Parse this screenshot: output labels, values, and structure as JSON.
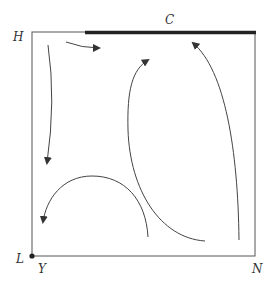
{
  "diagram": {
    "type": "phase-flow-diagram",
    "labels": {
      "top_left": "H",
      "top_bar": "C",
      "bottom_left": "L",
      "origin_below": "Y",
      "bottom_right": "N"
    },
    "colors": {
      "frame": "#555555",
      "thick_bar": "#222222",
      "curves": "#444444",
      "text": "#333333"
    },
    "flows": [
      {
        "id": "top-short",
        "direction": "right"
      },
      {
        "id": "left-descending",
        "direction": "down"
      },
      {
        "id": "arc-left",
        "direction": "down-left"
      },
      {
        "id": "middle-rising",
        "direction": "up"
      },
      {
        "id": "right-rising",
        "direction": "up"
      }
    ]
  }
}
